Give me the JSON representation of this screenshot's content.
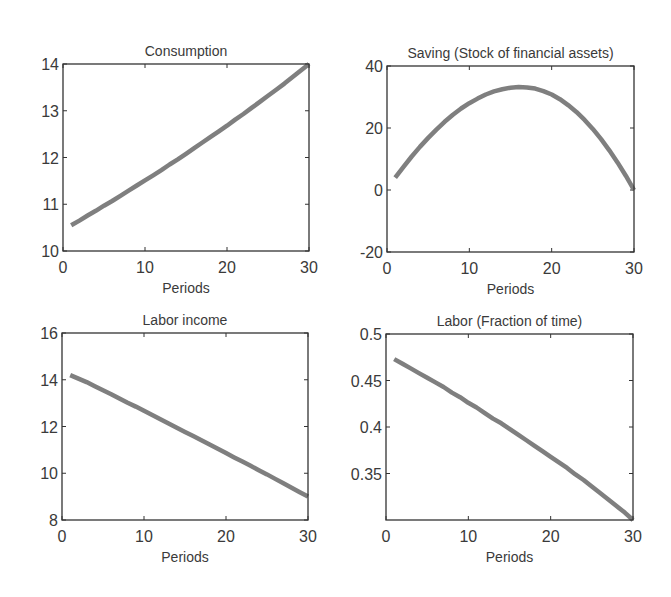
{
  "figure": {
    "line_color": "#7f7f7f",
    "axis_color": "#333333",
    "background": "#ffffff"
  },
  "chart_data": [
    {
      "id": "consumption",
      "type": "line",
      "title": "Consumption",
      "xlabel": "Periods",
      "ylabel": "",
      "xlim": [
        0,
        30
      ],
      "ylim": [
        10,
        14
      ],
      "xticks": [
        0,
        10,
        20,
        30
      ],
      "xtick_labels": [
        "0",
        "10",
        "20",
        "30"
      ],
      "yticks": [
        10,
        11,
        12,
        13,
        14
      ],
      "ytick_labels": [
        "10",
        "11",
        "12",
        "13",
        "14"
      ],
      "grid": false,
      "box": {
        "left": 63,
        "top": 64,
        "right": 309,
        "bottom": 251
      },
      "x": [
        1,
        2,
        3,
        4,
        5,
        6,
        7,
        8,
        9,
        10,
        11,
        12,
        13,
        14,
        15,
        16,
        17,
        18,
        19,
        20,
        21,
        22,
        23,
        24,
        25,
        26,
        27,
        28,
        29,
        30
      ],
      "values": [
        10.55,
        10.65,
        10.76,
        10.86,
        10.97,
        11.07,
        11.18,
        11.29,
        11.4,
        11.51,
        11.62,
        11.73,
        11.85,
        11.96,
        12.08,
        12.2,
        12.32,
        12.44,
        12.56,
        12.68,
        12.81,
        12.93,
        13.06,
        13.19,
        13.32,
        13.45,
        13.58,
        13.72,
        13.86,
        14.0
      ]
    },
    {
      "id": "saving",
      "type": "line",
      "title": "Saving (Stock of financial assets)",
      "xlabel": "Periods",
      "ylabel": "",
      "xlim": [
        0,
        30
      ],
      "ylim": [
        -20,
        40
      ],
      "xticks": [
        0,
        10,
        20,
        30
      ],
      "xtick_labels": [
        "0",
        "10",
        "20",
        "30"
      ],
      "yticks": [
        -20,
        0,
        20,
        40
      ],
      "ytick_labels": [
        "-20",
        "0",
        "20",
        "40"
      ],
      "grid": false,
      "box": {
        "left": 387,
        "top": 66,
        "right": 634,
        "bottom": 252
      },
      "x": [
        1,
        2,
        3,
        4,
        5,
        6,
        7,
        8,
        9,
        10,
        11,
        12,
        13,
        14,
        15,
        16,
        17,
        18,
        19,
        20,
        21,
        22,
        23,
        24,
        25,
        26,
        27,
        28,
        29,
        30
      ],
      "values": [
        4.0,
        7.5,
        10.8,
        13.9,
        16.8,
        19.5,
        22.0,
        24.3,
        26.3,
        28.0,
        29.5,
        30.8,
        31.8,
        32.5,
        33.0,
        33.2,
        33.1,
        32.7,
        31.9,
        30.8,
        29.3,
        27.4,
        25.2,
        22.6,
        19.7,
        16.4,
        12.8,
        8.9,
        4.6,
        0.0
      ]
    },
    {
      "id": "labor-income",
      "type": "line",
      "title": "Labor income",
      "xlabel": "Periods",
      "ylabel": "",
      "xlim": [
        0,
        30
      ],
      "ylim": [
        8,
        16
      ],
      "xticks": [
        0,
        10,
        20,
        30
      ],
      "xtick_labels": [
        "0",
        "10",
        "20",
        "30"
      ],
      "yticks": [
        8,
        10,
        12,
        14,
        16
      ],
      "ytick_labels": [
        "8",
        "10",
        "12",
        "14",
        "16"
      ],
      "grid": false,
      "box": {
        "left": 62,
        "top": 333,
        "right": 308,
        "bottom": 520
      },
      "x": [
        1,
        2,
        3,
        4,
        5,
        6,
        7,
        8,
        9,
        10,
        11,
        12,
        13,
        14,
        15,
        16,
        17,
        18,
        19,
        20,
        21,
        22,
        23,
        24,
        25,
        26,
        27,
        28,
        29,
        30
      ],
      "values": [
        14.2,
        14.05,
        13.9,
        13.72,
        13.55,
        13.38,
        13.2,
        13.02,
        12.85,
        12.67,
        12.49,
        12.31,
        12.13,
        11.95,
        11.77,
        11.59,
        11.41,
        11.23,
        11.05,
        10.86,
        10.68,
        10.5,
        10.32,
        10.13,
        9.95,
        9.76,
        9.57,
        9.38,
        9.19,
        9.0
      ]
    },
    {
      "id": "labor",
      "type": "line",
      "title": "Labor (Fraction of time)",
      "xlabel": "Periods",
      "ylabel": "",
      "xlim": [
        0,
        30
      ],
      "ylim": [
        0.3,
        0.5
      ],
      "xticks": [
        0,
        10,
        20,
        30
      ],
      "xtick_labels": [
        "0",
        "10",
        "20",
        "30"
      ],
      "yticks": [
        0.35,
        0.4,
        0.45,
        0.5
      ],
      "ytick_labels": [
        "0.35",
        "0.4",
        "0.45",
        "0.5"
      ],
      "grid": false,
      "box": {
        "left": 386,
        "top": 334,
        "right": 633,
        "bottom": 520
      },
      "x": [
        1,
        2,
        3,
        4,
        5,
        6,
        7,
        8,
        9,
        10,
        11,
        12,
        13,
        14,
        15,
        16,
        17,
        18,
        19,
        20,
        21,
        22,
        23,
        24,
        25,
        26,
        27,
        28,
        29,
        30
      ],
      "values": [
        0.473,
        0.468,
        0.463,
        0.458,
        0.453,
        0.448,
        0.443,
        0.437,
        0.432,
        0.426,
        0.421,
        0.415,
        0.409,
        0.404,
        0.398,
        0.392,
        0.386,
        0.38,
        0.374,
        0.368,
        0.362,
        0.356,
        0.349,
        0.343,
        0.336,
        0.329,
        0.322,
        0.315,
        0.308,
        0.3
      ]
    }
  ]
}
